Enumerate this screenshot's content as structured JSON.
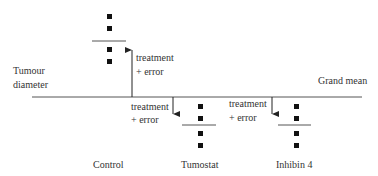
{
  "axis_label": {
    "line1": "Tumour",
    "line2": "diameter"
  },
  "grand_mean_label": "Grand mean",
  "annotations": [
    {
      "line1": "treatment",
      "line2": "+ error"
    },
    {
      "line1": "treatment",
      "line2": "+ error"
    },
    {
      "line1": "treatment",
      "line2": "+ error"
    }
  ],
  "groups": [
    {
      "name": "Control",
      "direction": "above",
      "points": 4
    },
    {
      "name": "Tumostat",
      "direction": "below",
      "points": 4
    },
    {
      "name": "Inhibin 4",
      "direction": "below",
      "points": 4
    }
  ],
  "colors": {
    "line": "#555555",
    "point": "#111111",
    "text": "#333333"
  }
}
